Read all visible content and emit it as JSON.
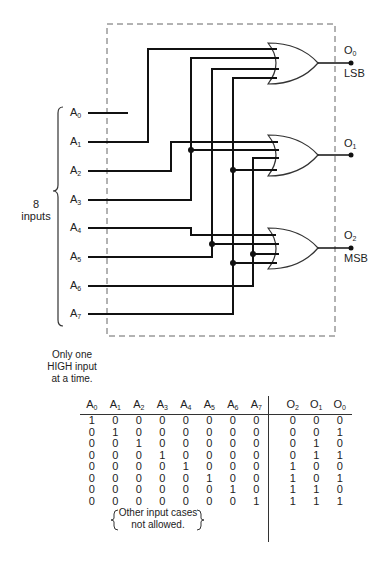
{
  "diagram": {
    "inputs": [
      "A0",
      "A1",
      "A2",
      "A3",
      "A4",
      "A5",
      "A6",
      "A7"
    ],
    "input_group_label": "8\ninputs",
    "outputs": [
      {
        "name": "O0",
        "note": "LSB"
      },
      {
        "name": "O1",
        "note": ""
      },
      {
        "name": "O2",
        "note": "MSB"
      }
    ],
    "constraint_note": "Only one HIGH input at a time.",
    "gate_type": "OR"
  },
  "labels": {
    "eight": "8",
    "inputs": "inputs",
    "note1": "Only one",
    "note2": "HIGH input",
    "note3": "at a time.",
    "lsb": "LSB",
    "msb": "MSB",
    "other1": "Other input cases",
    "other2": "not allowed."
  },
  "truth_table": {
    "input_headers": [
      "A",
      "A",
      "A",
      "A",
      "A",
      "A",
      "A",
      "A"
    ],
    "input_subs": [
      "0",
      "1",
      "2",
      "3",
      "4",
      "5",
      "6",
      "7"
    ],
    "output_headers": [
      "O",
      "O",
      "O"
    ],
    "output_subs": [
      "2",
      "1",
      "0"
    ],
    "rows": [
      {
        "in": [
          "1",
          "0",
          "0",
          "0",
          "0",
          "0",
          "0",
          "0"
        ],
        "out": [
          "0",
          "0",
          "0"
        ]
      },
      {
        "in": [
          "0",
          "1",
          "0",
          "0",
          "0",
          "0",
          "0",
          "0"
        ],
        "out": [
          "0",
          "0",
          "1"
        ]
      },
      {
        "in": [
          "0",
          "0",
          "1",
          "0",
          "0",
          "0",
          "0",
          "0"
        ],
        "out": [
          "0",
          "1",
          "0"
        ]
      },
      {
        "in": [
          "0",
          "0",
          "0",
          "1",
          "0",
          "0",
          "0",
          "0"
        ],
        "out": [
          "0",
          "1",
          "1"
        ]
      },
      {
        "in": [
          "0",
          "0",
          "0",
          "0",
          "1",
          "0",
          "0",
          "0"
        ],
        "out": [
          "1",
          "0",
          "0"
        ]
      },
      {
        "in": [
          "0",
          "0",
          "0",
          "0",
          "0",
          "1",
          "0",
          "0"
        ],
        "out": [
          "1",
          "0",
          "1"
        ]
      },
      {
        "in": [
          "0",
          "0",
          "0",
          "0",
          "0",
          "0",
          "1",
          "0"
        ],
        "out": [
          "1",
          "1",
          "0"
        ]
      },
      {
        "in": [
          "0",
          "0",
          "0",
          "0",
          "0",
          "0",
          "0",
          "1"
        ],
        "out": [
          "1",
          "1",
          "1"
        ]
      }
    ]
  }
}
